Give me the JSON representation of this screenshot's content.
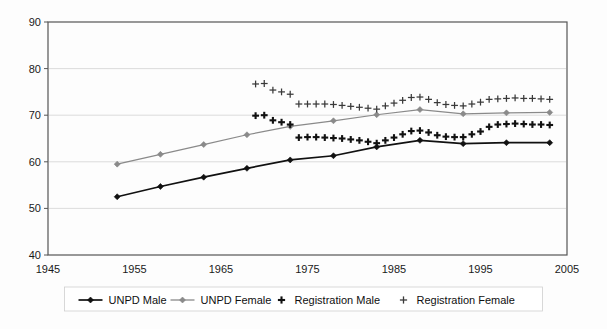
{
  "chart_data": {
    "type": "line",
    "title": "",
    "xlabel": "",
    "ylabel": "",
    "xlim": [
      1945,
      2005
    ],
    "ylim": [
      40,
      90
    ],
    "xticks": [
      1945,
      1955,
      1965,
      1975,
      1985,
      1995,
      2005
    ],
    "yticks": [
      40,
      50,
      60,
      70,
      80,
      90
    ],
    "grid": "horizontal",
    "legend_position": "bottom",
    "series": [
      {
        "name": "UNPD Male",
        "marker": "diamond",
        "line": true,
        "color": "#111111",
        "x": [
          1953,
          1958,
          1963,
          1968,
          1973,
          1978,
          1983,
          1988,
          1993,
          1998,
          2003
        ],
        "values": [
          52.5,
          54.7,
          56.7,
          58.6,
          60.4,
          61.3,
          63.2,
          64.6,
          63.9,
          64.1,
          64.1
        ]
      },
      {
        "name": "UNPD Female",
        "marker": "diamond",
        "line": true,
        "color": "#8a8a8a",
        "x": [
          1953,
          1958,
          1963,
          1968,
          1973,
          1978,
          1983,
          1988,
          1993,
          1998,
          2003
        ],
        "values": [
          59.5,
          61.6,
          63.7,
          65.8,
          67.6,
          68.8,
          70.1,
          71.2,
          70.3,
          70.5,
          70.6
        ]
      },
      {
        "name": "Registration Male",
        "marker": "plus-bold",
        "line": false,
        "color": "#111111",
        "x": [
          1969,
          1970,
          1971,
          1972,
          1973,
          1974,
          1975,
          1976,
          1977,
          1978,
          1979,
          1980,
          1981,
          1982,
          1983,
          1984,
          1985,
          1986,
          1987,
          1988,
          1989,
          1990,
          1991,
          1992,
          1993,
          1994,
          1995,
          1996,
          1997,
          1998,
          1999,
          2000,
          2001,
          2002,
          2003
        ],
        "values": [
          69.9,
          70.0,
          68.9,
          68.5,
          68.0,
          65.2,
          65.3,
          65.3,
          65.2,
          65.1,
          65.0,
          64.8,
          64.6,
          64.3,
          64.0,
          64.6,
          65.2,
          65.9,
          66.6,
          66.7,
          66.3,
          65.7,
          65.4,
          65.3,
          65.3,
          65.9,
          66.5,
          67.5,
          68.0,
          68.1,
          68.2,
          68.1,
          68.0,
          68.0,
          67.9
        ]
      },
      {
        "name": "Registration Female",
        "marker": "plus-light",
        "line": false,
        "color": "#3a3a3a",
        "x": [
          1969,
          1970,
          1971,
          1972,
          1973,
          1974,
          1975,
          1976,
          1977,
          1978,
          1979,
          1980,
          1981,
          1982,
          1983,
          1984,
          1985,
          1986,
          1987,
          1988,
          1989,
          1990,
          1991,
          1992,
          1993,
          1994,
          1995,
          1996,
          1997,
          1998,
          1999,
          2000,
          2001,
          2002,
          2003
        ],
        "values": [
          76.7,
          76.8,
          75.4,
          75.0,
          74.5,
          72.4,
          72.4,
          72.4,
          72.4,
          72.3,
          72.1,
          71.9,
          71.7,
          71.5,
          71.3,
          72.0,
          72.6,
          73.2,
          73.8,
          73.9,
          73.4,
          72.7,
          72.3,
          72.1,
          72.0,
          72.4,
          72.8,
          73.4,
          73.5,
          73.6,
          73.7,
          73.6,
          73.6,
          73.5,
          73.4
        ]
      }
    ]
  },
  "axis": {
    "y_labels": [
      "90",
      "80",
      "70",
      "60",
      "50",
      "40"
    ],
    "x_labels": [
      "1945",
      "1955",
      "1965",
      "1975",
      "1985",
      "1995",
      "2005"
    ]
  },
  "legend": {
    "items": [
      {
        "label": "UNPD Male",
        "marker": "line-diamond-dark"
      },
      {
        "label": "UNPD Female",
        "marker": "line-diamond-gray"
      },
      {
        "label": "Registration Male",
        "marker": "plus-bold"
      },
      {
        "label": "Registration Female",
        "marker": "plus-light"
      }
    ]
  }
}
